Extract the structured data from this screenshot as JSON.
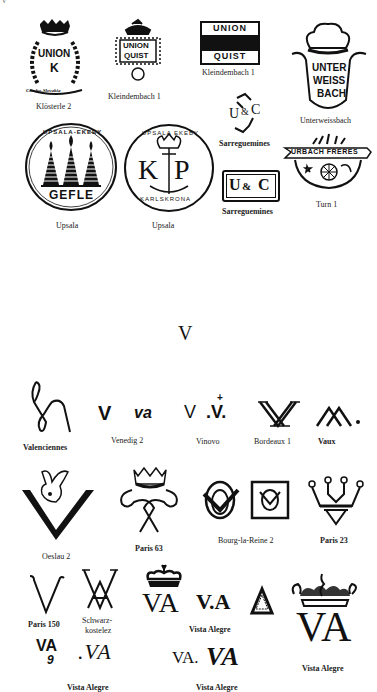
{
  "page": {
    "corner_mark": "V",
    "section_letter": "V"
  },
  "upper_marks": [
    {
      "id": "klosterle-2",
      "label": "Klösterle 2",
      "text": [
        "UNION",
        "K"
      ],
      "script": "Czecho-Slovakia"
    },
    {
      "id": "kleindembach-1a",
      "label": "Kleindembach 1",
      "text": [
        "UNION",
        "QUIST"
      ]
    },
    {
      "id": "kleindembach-1b",
      "label": "Kleindembach 1",
      "text": [
        "UNION",
        "QUIST"
      ]
    },
    {
      "id": "unterweissbach",
      "label": "Unterweissbach",
      "text": [
        "UNTER",
        "WEISS",
        "BACH"
      ]
    },
    {
      "id": "upsala-gefle",
      "label": "Upsala",
      "text": [
        "UPSALA-EKEBY",
        "GEFLE"
      ]
    },
    {
      "id": "upsala-karlskrona",
      "label": "Upsala",
      "text": [
        "UPSALA EKEBY",
        "K",
        "P",
        "KARLSKRONA"
      ]
    },
    {
      "id": "sarreguemines-1",
      "label": "Sarreguemines",
      "text": [
        "U",
        "&",
        "C"
      ]
    },
    {
      "id": "sarreguemines-2",
      "label": "Sarreguemines",
      "text": [
        "U",
        "&",
        "C"
      ]
    },
    {
      "id": "turn-1",
      "label": "Turn 1",
      "text": [
        "URBACH FRERES"
      ]
    }
  ],
  "v_marks": [
    {
      "id": "valenciennes",
      "label": "Valenciennes"
    },
    {
      "id": "venedig-2",
      "label": "Venedig 2",
      "text": [
        "V",
        "va"
      ]
    },
    {
      "id": "vinovo",
      "label": "Vinovo",
      "text": [
        "V",
        ".V."
      ]
    },
    {
      "id": "bordeaux-1",
      "label": "Bordeaux 1",
      "text": [
        "AV"
      ]
    },
    {
      "id": "vaux",
      "label": "Vaux",
      "text": [
        "AV"
      ]
    },
    {
      "id": "oeslau-2",
      "label": "Oeslau 2"
    },
    {
      "id": "paris-63",
      "label": "Paris 63"
    },
    {
      "id": "bourg-la-reine-2",
      "label": "Bourg-la-Reine 2"
    },
    {
      "id": "paris-23",
      "label": "Paris 23"
    },
    {
      "id": "paris-150",
      "label": "Paris 150",
      "text": [
        "V"
      ]
    },
    {
      "id": "schwarzkostelez",
      "label": "Schwarz-\nkostelez",
      "label_lines": [
        "Schwarz-",
        "kostelez"
      ]
    },
    {
      "id": "vista-alegre-1",
      "label": "Vista Alegre",
      "text": [
        "VA",
        "V.A"
      ]
    },
    {
      "id": "vista-alegre-2",
      "label": "Vista Alegre",
      "text": [
        "VA",
        "9",
        ".VA"
      ]
    },
    {
      "id": "vista-alegre-3",
      "label": "Vista Alegre",
      "text": [
        "VA.",
        "VA"
      ]
    },
    {
      "id": "vista-alegre-4",
      "label": "Vista Alegre",
      "text": [
        "VA"
      ]
    }
  ]
}
